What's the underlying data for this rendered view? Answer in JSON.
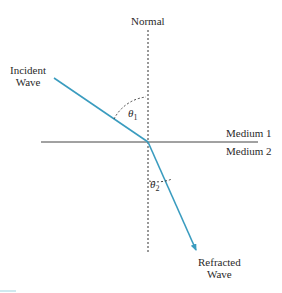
{
  "diagram": {
    "labels": {
      "normal": "Normal",
      "incident_line1": "Incident",
      "incident_line2": "Wave",
      "medium1": "Medium 1",
      "medium2": "Medium 2",
      "refracted_line1": "Refracted",
      "refracted_line2": "Wave",
      "theta1_symbol": "θ",
      "theta1_sub": "1",
      "theta2_symbol": "θ",
      "theta2_sub": "2"
    },
    "angles": {
      "incident_angle_from_normal_deg": 60,
      "refracted_angle_from_normal_deg": 22
    },
    "colors": {
      "ray": "#3a9cbf",
      "lines": "#333333",
      "text": "#2a2a2a"
    }
  }
}
